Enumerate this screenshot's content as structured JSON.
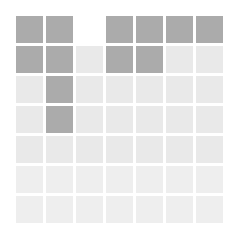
{
  "board": {
    "rows": 7,
    "cols": 7,
    "colors": {
      "dark": "#ababab",
      "light": "#e9e9e9",
      "lighter": "#eeeeee",
      "empty": "#ffffff"
    },
    "cells": [
      [
        "dark",
        "dark",
        "empty",
        "dark",
        "dark",
        "dark",
        "dark"
      ],
      [
        "dark",
        "dark",
        "light",
        "dark",
        "dark",
        "light",
        "light"
      ],
      [
        "light",
        "dark",
        "light",
        "light",
        "light",
        "light",
        "light"
      ],
      [
        "light",
        "dark",
        "light",
        "light",
        "light",
        "light",
        "light"
      ],
      [
        "light",
        "light",
        "light",
        "light",
        "light",
        "light",
        "light"
      ],
      [
        "lighter",
        "lighter",
        "lighter",
        "lighter",
        "lighter",
        "lighter",
        "lighter"
      ],
      [
        "lighter",
        "lighter",
        "lighter",
        "lighter",
        "lighter",
        "lighter",
        "lighter"
      ]
    ]
  }
}
